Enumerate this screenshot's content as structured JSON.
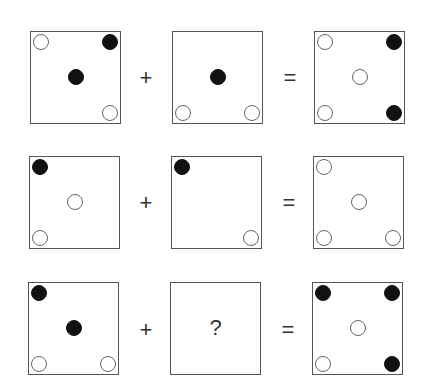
{
  "puzzle": {
    "operators": {
      "plus": "+",
      "equals": "="
    },
    "unknown": "?",
    "colors": {
      "filled": "#111111",
      "open_outline": "#666666",
      "border": "#555555"
    },
    "rows": [
      {
        "operand1": {
          "dots": [
            {
              "pos": "tl",
              "type": "open"
            },
            {
              "pos": "tr",
              "type": "filled"
            },
            {
              "pos": "c",
              "type": "filled"
            },
            {
              "pos": "br",
              "type": "open"
            }
          ]
        },
        "operand2": {
          "dots": [
            {
              "pos": "c",
              "type": "filled"
            },
            {
              "pos": "bl",
              "type": "open"
            },
            {
              "pos": "br",
              "type": "open"
            }
          ]
        },
        "result": {
          "dots": [
            {
              "pos": "tl",
              "type": "open"
            },
            {
              "pos": "tr",
              "type": "filled"
            },
            {
              "pos": "c",
              "type": "open"
            },
            {
              "pos": "bl",
              "type": "open"
            },
            {
              "pos": "br",
              "type": "filled"
            }
          ]
        }
      },
      {
        "operand1": {
          "dots": [
            {
              "pos": "tl",
              "type": "filled"
            },
            {
              "pos": "c",
              "type": "open"
            },
            {
              "pos": "bl",
              "type": "open"
            }
          ]
        },
        "operand2": {
          "dots": [
            {
              "pos": "tl",
              "type": "filled"
            },
            {
              "pos": "br",
              "type": "open"
            }
          ]
        },
        "result": {
          "dots": [
            {
              "pos": "tl",
              "type": "open"
            },
            {
              "pos": "c",
              "type": "open"
            },
            {
              "pos": "bl",
              "type": "open"
            },
            {
              "pos": "br",
              "type": "open"
            }
          ]
        }
      },
      {
        "operand1": {
          "dots": [
            {
              "pos": "tl",
              "type": "filled"
            },
            {
              "pos": "c",
              "type": "filled"
            },
            {
              "pos": "bl",
              "type": "open"
            },
            {
              "pos": "br",
              "type": "open"
            }
          ]
        },
        "operand2": {
          "unknown": true,
          "label": "?"
        },
        "result": {
          "dots": [
            {
              "pos": "tl",
              "type": "filled"
            },
            {
              "pos": "tr",
              "type": "filled"
            },
            {
              "pos": "c",
              "type": "open"
            },
            {
              "pos": "bl",
              "type": "open"
            },
            {
              "pos": "br",
              "type": "filled"
            }
          ]
        }
      }
    ]
  }
}
